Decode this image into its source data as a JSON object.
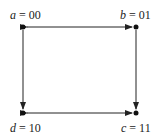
{
  "diagram": {
    "type": "state-graph",
    "nodes": [
      {
        "id": "a",
        "var": "a",
        "value": "00",
        "x": 23,
        "y": 27
      },
      {
        "id": "b",
        "var": "b",
        "value": "01",
        "x": 136,
        "y": 27
      },
      {
        "id": "c",
        "var": "c",
        "value": "11",
        "x": 136,
        "y": 113
      },
      {
        "id": "d",
        "var": "d",
        "value": "10",
        "x": 23,
        "y": 113
      }
    ],
    "edges": [
      {
        "from": "a",
        "to": "b",
        "bidirectional": true
      },
      {
        "from": "a",
        "to": "d",
        "bidirectional": false
      },
      {
        "from": "b",
        "to": "c",
        "bidirectional": false
      },
      {
        "from": "d",
        "to": "c",
        "bidirectional": true
      }
    ],
    "labels": {
      "a": {
        "var": "a",
        "eq": " = ",
        "value": "00"
      },
      "b": {
        "var": "b",
        "eq": " = ",
        "value": "01"
      },
      "c": {
        "var": "c",
        "eq": " = ",
        "value": "11"
      },
      "d": {
        "var": "d",
        "eq": " = ",
        "value": "10"
      }
    },
    "colors": {
      "line": "#222222",
      "node": "#111111"
    }
  }
}
